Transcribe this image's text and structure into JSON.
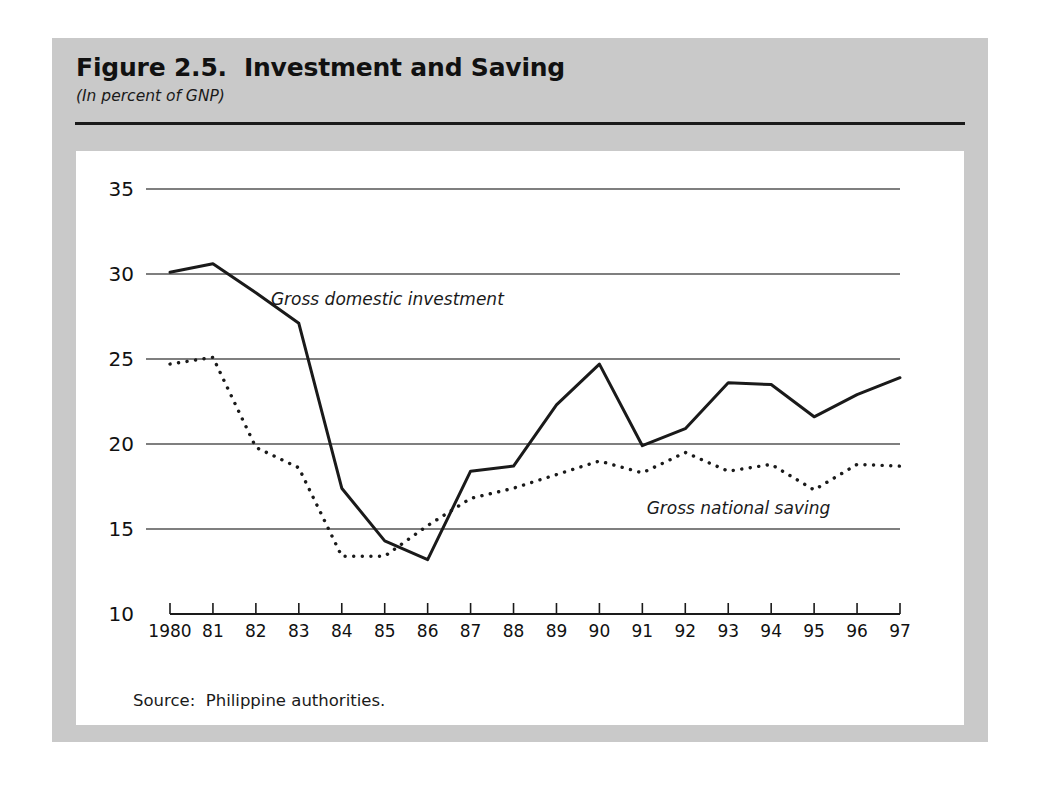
{
  "figure": {
    "title": "Figure 2.5.  Investment and Saving",
    "subtitle": "(In percent of GNP)",
    "source": "Source:  Philippine authorities."
  },
  "chart_data": {
    "type": "line",
    "title": "Figure 2.5.  Investment and Saving",
    "subtitle": "(In percent of GNP)",
    "xlabel": "",
    "ylabel": "",
    "ylim": [
      10,
      35
    ],
    "yticks": [
      10,
      15,
      20,
      25,
      30,
      35
    ],
    "grid": true,
    "legend_position": "inline-annotation",
    "x": [
      1980,
      1981,
      1982,
      1983,
      1984,
      1985,
      1986,
      1987,
      1988,
      1989,
      1990,
      1991,
      1992,
      1993,
      1994,
      1995,
      1996,
      1997
    ],
    "xtick_labels": [
      "1980",
      "81",
      "82",
      "83",
      "84",
      "85",
      "86",
      "87",
      "88",
      "89",
      "90",
      "91",
      "92",
      "93",
      "94",
      "95",
      "96",
      "97"
    ],
    "series": [
      {
        "name": "Gross domestic investment",
        "style": "solid",
        "color": "#1a1a1a",
        "values": [
          30.1,
          30.6,
          28.9,
          27.1,
          17.4,
          14.3,
          13.2,
          18.4,
          18.7,
          22.3,
          24.7,
          19.9,
          20.9,
          23.6,
          23.5,
          21.6,
          22.9,
          23.9
        ]
      },
      {
        "name": "Gross national saving",
        "style": "dotted",
        "color": "#1a1a1a",
        "values": [
          24.7,
          25.1,
          19.8,
          18.6,
          13.4,
          13.4,
          15.2,
          16.8,
          17.4,
          18.2,
          19.0,
          18.3,
          19.5,
          18.4,
          18.8,
          17.3,
          18.8,
          18.7
        ]
      }
    ],
    "annotations": [
      {
        "text": "Gross domestic investment",
        "x": 1982.35,
        "y": 28.2
      },
      {
        "text": "Gross national saving",
        "x": 1991.1,
        "y": 15.9
      }
    ]
  },
  "colors": {
    "panel_background": "#c9c9c9",
    "plot_background": "#ffffff",
    "line": "#1a1a1a",
    "gridline": "#555555",
    "rule": "#1a1a1a"
  }
}
